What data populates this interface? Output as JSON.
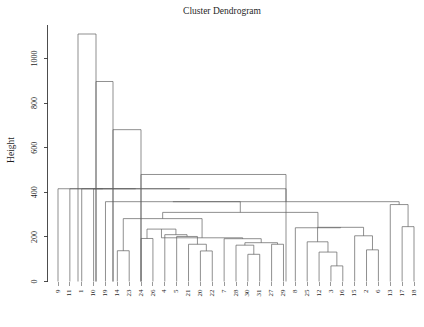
{
  "chart_data": {
    "type": "dendrogram",
    "title": "Cluster Dendrogram",
    "xlabel": "",
    "ylabel": "Height",
    "ylim": [
      0,
      1110
    ],
    "grid": false,
    "legend": null,
    "yticks": [
      0,
      200,
      400,
      600,
      800,
      1000
    ],
    "ytick_labels": [
      "0",
      "200",
      "400",
      "600",
      "800",
      "1000"
    ],
    "leaf_order": [
      "9",
      "11",
      "1",
      "10",
      "19",
      "14",
      "23",
      "24",
      "26",
      "4",
      "5",
      "21",
      "20",
      "22",
      "7",
      "28",
      "30",
      "31",
      "27",
      "29",
      "8",
      "25",
      "12",
      "3",
      "16",
      "15",
      "2",
      "6",
      "13",
      "17",
      "18"
    ],
    "n_leaves": 31,
    "merges": [
      {
        "id": "m1",
        "left": "14",
        "right": "23",
        "height": 138
      },
      {
        "id": "m2",
        "left": "24",
        "right": "26",
        "height": 193
      },
      {
        "id": "m3",
        "left": "20",
        "right": "22",
        "height": 137
      },
      {
        "id": "m4",
        "left": "21",
        "right": "m3",
        "height": 167
      },
      {
        "id": "m5",
        "left": "5",
        "right": "m4",
        "height": 202
      },
      {
        "id": "m6",
        "left": "4",
        "right": "m5",
        "height": 210
      },
      {
        "id": "m7",
        "left": "m2",
        "right": "m6",
        "height": 235
      },
      {
        "id": "m8",
        "left": "30",
        "right": "31",
        "height": 122
      },
      {
        "id": "m9",
        "left": "28",
        "right": "m8",
        "height": 163
      },
      {
        "id": "m10",
        "left": "27",
        "right": "29",
        "height": 167
      },
      {
        "id": "m11",
        "left": "m9",
        "right": "m10",
        "height": 174
      },
      {
        "id": "m12",
        "left": "7",
        "right": "m11",
        "height": 192
      },
      {
        "id": "m13",
        "left": "m7",
        "right": "m12",
        "height": 196
      },
      {
        "id": "m14",
        "left": "m1",
        "right": "m13",
        "height": 282
      },
      {
        "id": "m15",
        "left": "3",
        "right": "16",
        "height": 70
      },
      {
        "id": "m16",
        "left": "12",
        "right": "m15",
        "height": 132
      },
      {
        "id": "m17",
        "left": "25",
        "right": "m16",
        "height": 178
      },
      {
        "id": "m18",
        "left": "2",
        "right": "6",
        "height": 142
      },
      {
        "id": "m19",
        "left": "15",
        "right": "m18",
        "height": 205
      },
      {
        "id": "m20",
        "left": "m17",
        "right": "m19",
        "height": 243
      },
      {
        "id": "m21",
        "left": "8",
        "right": "m20",
        "height": 241
      },
      {
        "id": "m22",
        "left": "m14",
        "right": "m21",
        "height": 310
      },
      {
        "id": "m23",
        "left": "19",
        "right": "m22",
        "height": 358
      },
      {
        "id": "m24",
        "left": "17",
        "right": "18",
        "height": 246
      },
      {
        "id": "m25",
        "left": "13",
        "right": "m24",
        "height": 345
      },
      {
        "id": "m26",
        "left": "m23",
        "right": "m25",
        "height": 358
      },
      {
        "id": "m27",
        "left": "10",
        "right": "m26",
        "height": 416
      },
      {
        "id": "m28",
        "left": "1",
        "right": "m27",
        "height": 416
      },
      {
        "id": "m29",
        "left": "11",
        "right": "m28",
        "height": 416
      },
      {
        "id": "m30",
        "left": "9",
        "right": "m29",
        "height": 416
      },
      {
        "id": "m31",
        "left": "sub_a",
        "right": "sub_b",
        "height": 0
      }
    ],
    "upper_structure": [
      {
        "id": "u1",
        "height": 480,
        "x_left": 141,
        "x_right": 286
      },
      {
        "id": "u2",
        "height": 681,
        "x_left": 113,
        "x_right": 141
      },
      {
        "id": "u3",
        "height": 897,
        "x_left": 96,
        "x_right": 113
      },
      {
        "id": "u4",
        "height": 1110,
        "x_left": 78,
        "x_right": 96
      }
    ],
    "colors": {
      "line": "#606060",
      "axis": "#3a3a3a",
      "text": "#1f1f1f",
      "background": "#ffffff"
    }
  },
  "plot": {
    "title": "Cluster Dendrogram",
    "y_axis_title": "Height"
  }
}
